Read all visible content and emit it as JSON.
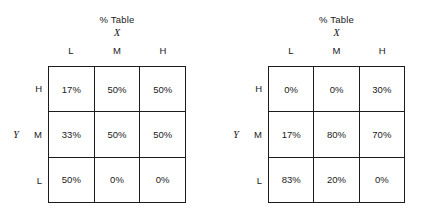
{
  "page": {
    "background_color": "#ffffff",
    "text_color": "#1a1a1a",
    "border_color": "#1c1c1c"
  },
  "tables": [
    {
      "title": "% Table",
      "x_variable": "X",
      "y_variable": "Y",
      "column_headers": [
        "L",
        "M",
        "H"
      ],
      "row_headers": [
        "H",
        "M",
        "L"
      ],
      "rows": [
        [
          "17%",
          "50%",
          "50%"
        ],
        [
          "33%",
          "50%",
          "50%"
        ],
        [
          "50%",
          "0%",
          "0%"
        ]
      ]
    },
    {
      "title": "% Table",
      "x_variable": "X",
      "y_variable": "Y",
      "column_headers": [
        "L",
        "M",
        "H"
      ],
      "row_headers": [
        "H",
        "M",
        "L"
      ],
      "rows": [
        [
          "0%",
          "0%",
          "30%"
        ],
        [
          "17%",
          "80%",
          "70%"
        ],
        [
          "83%",
          "20%",
          "0%"
        ]
      ]
    }
  ],
  "chart_data": [
    {
      "type": "table",
      "title": "% Table",
      "xlabel": "X",
      "ylabel": "Y",
      "categories": [
        "L",
        "M",
        "H"
      ],
      "row_categories": [
        "H",
        "M",
        "L"
      ],
      "values": [
        [
          17,
          50,
          50
        ],
        [
          33,
          50,
          50
        ],
        [
          50,
          0,
          0
        ]
      ],
      "unit": "%",
      "grid": true,
      "legend": "none"
    },
    {
      "type": "table",
      "title": "% Table",
      "xlabel": "X",
      "ylabel": "Y",
      "categories": [
        "L",
        "M",
        "H"
      ],
      "row_categories": [
        "H",
        "M",
        "L"
      ],
      "values": [
        [
          0,
          0,
          30
        ],
        [
          17,
          80,
          70
        ],
        [
          83,
          20,
          0
        ]
      ],
      "unit": "%",
      "grid": true,
      "legend": "none"
    }
  ]
}
